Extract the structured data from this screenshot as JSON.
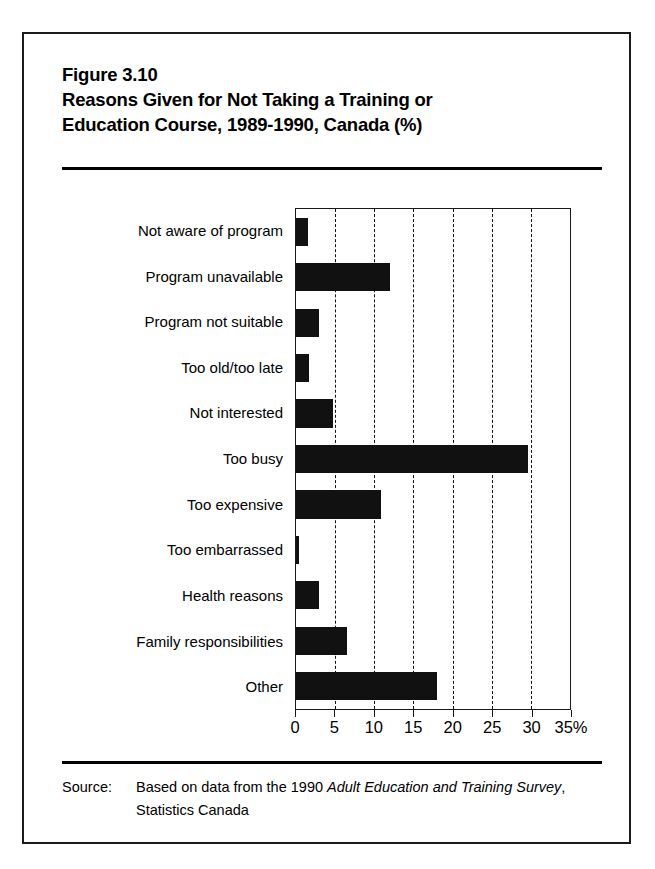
{
  "figure": {
    "number_label": "Figure 3.10",
    "title_line_1": "Reasons Given for Not Taking a Training or",
    "title_line_2": "Education Course, 1989-1990, Canada (%)"
  },
  "source": {
    "label": "Source:",
    "text_before_italic": "Based on data from the 1990 ",
    "italic_text": "Adult Education and Training Survey",
    "text_after_italic": ", Statistics Canada",
    "full_text": "Source:  Based on data from the 1990 Adult Education and Training Survey, Statistics Canada"
  },
  "colors": {
    "bar_fill": "#111111",
    "axis": "#1a1a1a",
    "background": "#ffffff",
    "gridline": "#111111"
  },
  "chart_data": {
    "type": "bar",
    "orientation": "horizontal",
    "xlabel": "",
    "ylabel": "",
    "xlim": [
      0,
      35
    ],
    "grid": "vertical-dashed",
    "legend": "none",
    "x_tick_labels": [
      "0",
      "5",
      "10",
      "15",
      "20",
      "25",
      "30",
      "35%"
    ],
    "x_ticks": [
      0,
      5,
      10,
      15,
      20,
      25,
      30,
      35
    ],
    "gridline_positions": [
      5,
      10,
      15,
      20,
      25,
      30
    ],
    "categories": [
      "Not aware of program",
      "Program unavailable",
      "Program not suitable",
      "Too old/too late",
      "Not interested",
      "Too busy",
      "Too expensive",
      "Too embarrassed",
      "Health reasons",
      "Family responsibilities",
      "Other"
    ],
    "values": [
      1.5,
      12.0,
      3.0,
      1.6,
      4.7,
      29.6,
      10.8,
      0.4,
      3.0,
      6.5,
      18.0
    ],
    "units": "%"
  }
}
